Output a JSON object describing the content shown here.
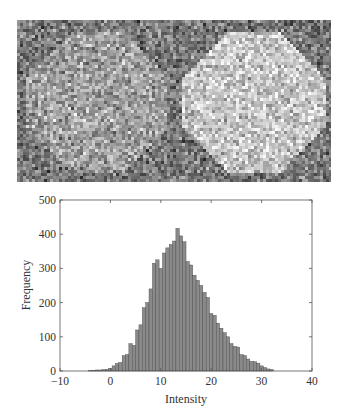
{
  "image_panel": {
    "description": "Noisy grayscale image with two bright circular regions",
    "regions": [
      {
        "name": "left-disk",
        "cx": 0.25,
        "cy": 0.5,
        "r": 0.44,
        "brightness": "medium"
      },
      {
        "name": "right-disk",
        "cx": 0.75,
        "cy": 0.5,
        "r": 0.44,
        "brightness": "high"
      }
    ]
  },
  "chart_data": {
    "type": "bar",
    "title": "",
    "xlabel": "Intensity",
    "ylabel": "Frequency",
    "xlim": [
      -10,
      40
    ],
    "ylim": [
      0,
      500
    ],
    "xticks": [
      "-10",
      "0",
      "10",
      "20",
      "30",
      "40"
    ],
    "yticks": [
      "0",
      "100",
      "200",
      "300",
      "400",
      "500"
    ],
    "grid": false,
    "legend": null,
    "bin_width": 0.67,
    "x": [
      -4.0,
      -3.33,
      -2.67,
      -2.0,
      -1.33,
      -0.67,
      0.0,
      0.67,
      1.33,
      2.0,
      2.67,
      3.33,
      4.0,
      4.67,
      5.33,
      6.0,
      6.67,
      7.33,
      8.0,
      8.67,
      9.33,
      10.0,
      10.67,
      11.33,
      12.0,
      12.67,
      13.33,
      14.0,
      14.67,
      15.33,
      16.0,
      16.67,
      17.33,
      18.0,
      18.67,
      19.33,
      20.0,
      20.67,
      21.33,
      22.0,
      22.67,
      23.33,
      24.0,
      24.67,
      25.33,
      26.0,
      26.67,
      27.33,
      28.0,
      28.67,
      29.33,
      30.0,
      30.67,
      31.33,
      32.0
    ],
    "values": [
      1,
      2,
      3,
      3,
      4,
      5,
      8,
      15,
      22,
      25,
      45,
      48,
      80,
      75,
      120,
      135,
      185,
      200,
      240,
      315,
      325,
      300,
      345,
      360,
      370,
      380,
      417,
      395,
      378,
      320,
      310,
      280,
      265,
      250,
      230,
      215,
      168,
      163,
      140,
      125,
      112,
      100,
      80,
      72,
      70,
      48,
      45,
      35,
      28,
      27,
      23,
      15,
      10,
      6,
      4
    ]
  }
}
